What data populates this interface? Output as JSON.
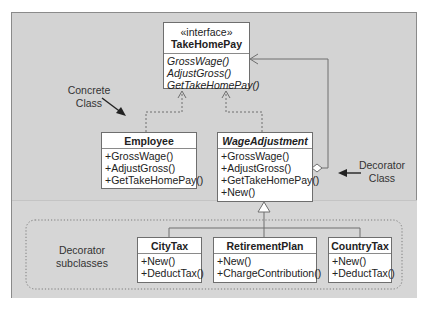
{
  "diagram": {
    "interface": {
      "stereotype": "«interface»",
      "name": "TakeHomePay",
      "operations": [
        "GrossWage()",
        "AdjustGross()",
        "GetTakeHomePay()"
      ]
    },
    "employee": {
      "name": "Employee",
      "operations": [
        "+GrossWage()",
        "+AdjustGross()",
        "+GetTakeHomePay()"
      ]
    },
    "wage_adjustment": {
      "name": "WageAdjustment",
      "operations": [
        "+GrossWage()",
        "+AdjustGross()",
        "+GetTakeHomePay()",
        "+New()"
      ]
    },
    "subclasses": [
      {
        "name": "CityTax",
        "operations": [
          "+New()",
          "+DeductTax()"
        ]
      },
      {
        "name": "RetirementPlan",
        "operations": [
          "+New()",
          "+ChargeContribution()"
        ]
      },
      {
        "name": "CountryTax",
        "operations": [
          "+New()",
          "+DeductTax()"
        ]
      }
    ],
    "annotations": {
      "concrete_class": [
        "Concrete",
        "Class"
      ],
      "decorator_class": [
        "Decorator",
        "Class"
      ],
      "decorator_subclasses": [
        "Decorator",
        "subclasses"
      ]
    },
    "colors": {
      "frame_bg": "#d3d3d3",
      "box_bg": "#ffffff",
      "line": "#6e6e6e"
    }
  }
}
